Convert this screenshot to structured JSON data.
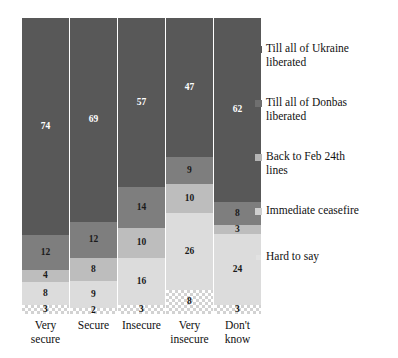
{
  "chart": {
    "title": "",
    "title_visible_fragment": ""
  },
  "chart_data": {
    "type": "bar",
    "subtype": "stacked-bar-100",
    "title": "",
    "xlabel": "",
    "ylabel": "",
    "ylim": [
      0,
      100
    ],
    "grid": false,
    "legend_position": "right",
    "categories": [
      "Very secure",
      "Secure",
      "Insecure",
      "Very insecure",
      "Don't know"
    ],
    "series": [
      {
        "name": "Till all of Ukraine liberated",
        "color": "#585858",
        "values": [
          74,
          69,
          57,
          47,
          62
        ]
      },
      {
        "name": "Till all of Donbas liberated",
        "color": "#7e7e7e",
        "values": [
          12,
          12,
          14,
          9,
          8
        ]
      },
      {
        "name": "Back to Feb 24th lines",
        "color": "#bdbdbd",
        "values": [
          4,
          8,
          10,
          10,
          3
        ]
      },
      {
        "name": "Immediate ceasefire",
        "color": "#dcdcdc",
        "values": [
          8,
          9,
          16,
          26,
          24
        ]
      },
      {
        "name": "Hard to say",
        "color": "#ffffff",
        "pattern": "checkered",
        "values": [
          3,
          2,
          3,
          8,
          3
        ]
      }
    ]
  },
  "bars": [
    {
      "category_line1": "Very",
      "category_line2": "secure",
      "segments": [
        {
          "label": "74",
          "value": 74
        },
        {
          "label": "12",
          "value": 12
        },
        {
          "label": "4",
          "value": 4
        },
        {
          "label": "8",
          "value": 8
        },
        {
          "label": "3",
          "value": 3
        }
      ]
    },
    {
      "category_line1": "Secure",
      "category_line2": "",
      "segments": [
        {
          "label": "69",
          "value": 69
        },
        {
          "label": "12",
          "value": 12
        },
        {
          "label": "8",
          "value": 8
        },
        {
          "label": "9",
          "value": 9
        },
        {
          "label": "2",
          "value": 2
        }
      ]
    },
    {
      "category_line1": "Insecure",
      "category_line2": "",
      "segments": [
        {
          "label": "57",
          "value": 57
        },
        {
          "label": "14",
          "value": 14
        },
        {
          "label": "10",
          "value": 10
        },
        {
          "label": "16",
          "value": 16
        },
        {
          "label": "3",
          "value": 3
        }
      ]
    },
    {
      "category_line1": "Very",
      "category_line2": "insecure",
      "segments": [
        {
          "label": "47",
          "value": 47
        },
        {
          "label": "9",
          "value": 9
        },
        {
          "label": "10",
          "value": 10
        },
        {
          "label": "26",
          "value": 26
        },
        {
          "label": "8",
          "value": 8
        }
      ]
    },
    {
      "category_line1": "Don't",
      "category_line2": "know",
      "segments": [
        {
          "label": "62",
          "value": 62
        },
        {
          "label": "8",
          "value": 8
        },
        {
          "label": "3",
          "value": 3
        },
        {
          "label": "24",
          "value": 24
        },
        {
          "label": "3",
          "value": 3
        }
      ]
    }
  ],
  "legend": {
    "items": [
      {
        "line1": "Till all of Ukraine",
        "line2": "liberated",
        "color": "#585858"
      },
      {
        "line1": "Till all of Donbas",
        "line2": "liberated",
        "color": "#6f6f6f"
      },
      {
        "line1": "Back to Feb 24th",
        "line2": "lines",
        "color": "#b4b4b4"
      },
      {
        "line1": "Immediate ceasefire",
        "line2": "",
        "color": "#cfcfcf"
      },
      {
        "line1": "Hard to say",
        "line2": "",
        "color": "#e2e2e2"
      }
    ]
  }
}
